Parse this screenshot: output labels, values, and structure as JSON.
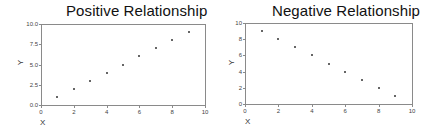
{
  "chart_data": [
    {
      "type": "scatter",
      "title": "Positive Relationship",
      "xlabel": "X",
      "ylabel": "Y",
      "xlim": [
        0,
        10
      ],
      "ylim": [
        0,
        10
      ],
      "x_ticks": [
        "0",
        "2",
        "4",
        "6",
        "8",
        "10"
      ],
      "y_ticks": [
        "0.0",
        "2.5",
        "5.0",
        "7.5",
        "10.0"
      ],
      "grid": false,
      "legend": null,
      "points": [
        [
          1,
          1
        ],
        [
          2,
          2
        ],
        [
          3,
          3
        ],
        [
          4,
          4
        ],
        [
          5,
          5
        ],
        [
          6,
          6
        ],
        [
          7,
          7
        ],
        [
          8,
          8
        ],
        [
          9,
          9
        ]
      ]
    },
    {
      "type": "scatter",
      "title": "Negative Relationship",
      "xlabel": "X",
      "ylabel": "Y",
      "xlim": [
        0,
        10
      ],
      "ylim": [
        0,
        10
      ],
      "x_ticks": [
        "0",
        "2",
        "4",
        "6",
        "8",
        "10"
      ],
      "y_ticks": [
        "0",
        "2",
        "4",
        "6",
        "8",
        "10"
      ],
      "grid": false,
      "legend": null,
      "points": [
        [
          1,
          9
        ],
        [
          2,
          8
        ],
        [
          3,
          7
        ],
        [
          4,
          6
        ],
        [
          5,
          5
        ],
        [
          6,
          4
        ],
        [
          7,
          3
        ],
        [
          8,
          2
        ],
        [
          9,
          1
        ]
      ]
    }
  ],
  "charts": [
    {
      "title": "Positive Relationship",
      "xlabel": "X",
      "ylabel": "Y",
      "x_ticks": [
        "0",
        "2",
        "4",
        "6",
        "8",
        "10"
      ],
      "y_ticks": [
        "0.0",
        "2.5",
        "5.0",
        "7.5",
        "10.0"
      ]
    },
    {
      "title": "Negative Relationship",
      "xlabel": "X",
      "ylabel": "Y",
      "x_ticks": [
        "0",
        "2",
        "4",
        "6",
        "8",
        "10"
      ],
      "y_ticks": [
        "0",
        "2",
        "4",
        "6",
        "8",
        "10"
      ]
    }
  ],
  "colors": {
    "frame": "#8a8a8a",
    "point": "#333333",
    "background": "#ffffff"
  }
}
